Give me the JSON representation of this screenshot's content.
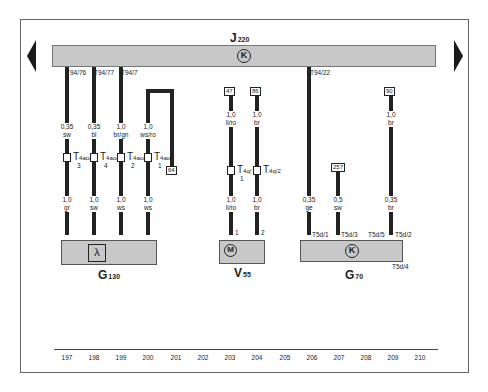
{
  "diagram": {
    "type": "wiring-diagram",
    "control_unit": {
      "label": "J",
      "sub": "220",
      "symbol": "K"
    },
    "navigation": {
      "prev": "previous-page",
      "next": "next-page"
    },
    "bus_pins": [
      "T94/76",
      "T94/77",
      "T94/7",
      "T94/22"
    ],
    "wires": [
      {
        "top_size": "0,35",
        "top_color": "sw",
        "connector": "T4ao/",
        "connector_pin": "3",
        "bottom_size": "1,0",
        "bottom_color": "gr"
      },
      {
        "top_size": "0,35",
        "top_color": "bl",
        "connector": "T4ao/",
        "connector_pin": "4",
        "bottom_size": "1,0",
        "bottom_color": "sw"
      },
      {
        "top_size": "1,0",
        "top_color": "br/gn",
        "connector": "T4ao/",
        "connector_pin": "2",
        "bottom_size": "1,0",
        "bottom_color": "ws"
      },
      {
        "top_size": "1,0",
        "top_color": "ws/ro",
        "connector": "T4ao/",
        "connector_pin": "1",
        "bottom_size": "1,0",
        "bottom_color": "ws"
      }
    ],
    "ref_64": "64",
    "components": {
      "g130": {
        "label": "G",
        "sub": "130",
        "symbol": "λ"
      },
      "v55": {
        "label": "V",
        "sub": "55",
        "symbol": "M",
        "terminals": [
          "47",
          "86"
        ],
        "wires": [
          {
            "top_size": "1,0",
            "top_color": "li/ro",
            "connector": "T4q/",
            "connector_pin": "1",
            "bottom_size": "1,0",
            "bottom_color": "li/ro",
            "pin": "1"
          },
          {
            "top_size": "1,0",
            "top_color": "br",
            "connector": "T4q/2",
            "bottom_size": "1,0",
            "bottom_color": "br",
            "pin": "2"
          }
        ]
      },
      "g70": {
        "label": "G",
        "sub": "70",
        "symbol": "K",
        "terminals": [
          "257",
          "90"
        ],
        "wires": [
          {
            "size": "0,35",
            "color": "ge",
            "pin": "T5d/1"
          },
          {
            "size": "0,5",
            "color": "sw",
            "pin": "T5d/3"
          },
          {
            "pin": "T5d/5"
          },
          {
            "top_size": "1,0",
            "top_color": "br",
            "size": "0,35",
            "color": "br",
            "pin": "T5d/2"
          }
        ],
        "ground_pin": "T5d/4"
      }
    },
    "columns": [
      "197",
      "198",
      "199",
      "200",
      "201",
      "202",
      "203",
      "204",
      "205",
      "206",
      "207",
      "208",
      "209",
      "210"
    ]
  }
}
